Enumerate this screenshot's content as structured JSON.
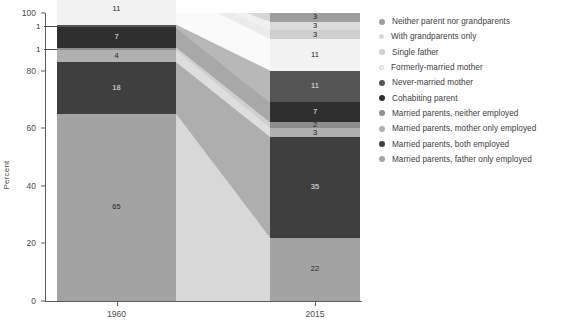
{
  "chart_data": {
    "type": "bar",
    "title": "",
    "subtitle": "",
    "xlabel": "",
    "ylabel": "Percent",
    "categories": [
      "1960",
      "2015"
    ],
    "ylim": [
      0,
      100
    ],
    "yticks": [
      0,
      20,
      40,
      60,
      80,
      100
    ],
    "ytick_labels": [
      "0",
      "20",
      "40",
      "60",
      "80",
      "100"
    ],
    "grid": false,
    "legend_position": "right",
    "stacked": true,
    "series": [
      {
        "name": "Married parents, father only employed",
        "color": "#a3a3a3",
        "values": [
          65,
          22
        ]
      },
      {
        "name": "Married parents, both employed",
        "color": "#3f3f3f",
        "values": [
          18,
          35
        ]
      },
      {
        "name": "Married parents, mother only employed",
        "color": "#b0b0b0",
        "values": [
          4,
          3
        ]
      },
      {
        "name": "Married parents, neither employed",
        "color": "#8d8d8d",
        "values": [
          1,
          2
        ]
      },
      {
        "name": "Cohabiting parent",
        "color": "#2f2f2f",
        "values": [
          7,
          7
        ]
      },
      {
        "name": "Never-married mother",
        "color": "#555555",
        "values": [
          1,
          11
        ]
      },
      {
        "name": "Formerly-married mother",
        "color": "#f2f2f2",
        "values": [
          11,
          11
        ]
      },
      {
        "name": "Single father",
        "color": "#cfcfcf",
        "values": [
          2,
          3
        ]
      },
      {
        "name": "With grandparents only",
        "color": "#dcdcdc",
        "values": [
          0,
          3
        ]
      },
      {
        "name": "Neither parent nor grandparents",
        "color": "#9e9e9e",
        "values": [
          0,
          3
        ]
      }
    ],
    "bar_labels": {
      "1960": [
        "65",
        "18",
        "4",
        "1",
        "7",
        "1",
        "11",
        "2"
      ],
      "2015": [
        "22",
        "35",
        "3",
        "2",
        "7",
        "11",
        "11",
        "3",
        "3",
        "3"
      ]
    },
    "callouts": [
      {
        "text": "1",
        "series": "Married parents, neither employed",
        "category": "1960"
      },
      {
        "text": "1",
        "series": "Never-married mother",
        "category": "1960"
      }
    ]
  },
  "legend": {
    "items": [
      {
        "label": "Neither parent nor grandparents",
        "color": "#9e9e9e"
      },
      {
        "label": "With grandparents only",
        "color": "#dcdcdc"
      },
      {
        "label": "Single father",
        "color": "#cfcfcf"
      },
      {
        "label": "Formerly-married mother",
        "color": "#f2f2f2"
      },
      {
        "label": "Never-married mother",
        "color": "#555555"
      },
      {
        "label": "Cohabiting parent",
        "color": "#2f2f2f"
      },
      {
        "label": "Married parents, neither employed",
        "color": "#8d8d8d"
      },
      {
        "label": "Married parents, mother only employed",
        "color": "#b0b0b0"
      },
      {
        "label": "Married parents, both employed",
        "color": "#3f3f3f"
      },
      {
        "label": "Married parents, father only employed",
        "color": "#a3a3a3"
      }
    ]
  },
  "axis": {
    "y_title": "Percent",
    "y_ticks": [
      "100",
      "80",
      "60",
      "40",
      "20",
      "0"
    ],
    "x_ticks": [
      "1960",
      "2015"
    ]
  }
}
